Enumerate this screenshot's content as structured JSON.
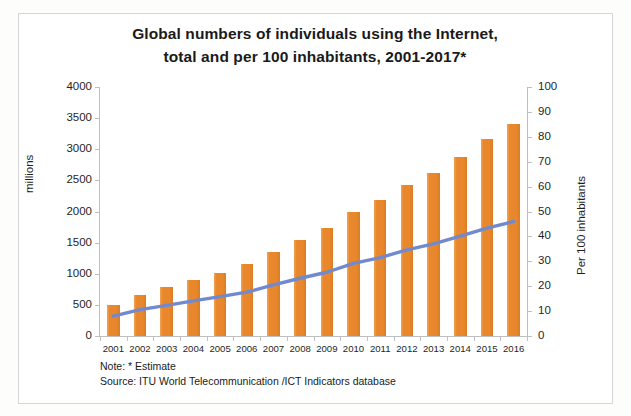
{
  "title": {
    "line1": "Global numbers of individuals using the Internet,",
    "line2": "total and per 100 inhabitants, 2001-2017*"
  },
  "legend": {
    "label": "Individuals using the Internet (in millions)",
    "swatch_color": "#e8872b"
  },
  "axes": {
    "left_title": "millions",
    "right_title": "Per 100 inhabitants",
    "left_ticks": [
      "0",
      "500",
      "1000",
      "1500",
      "2000",
      "2500",
      "3000",
      "3500",
      "4000"
    ],
    "right_ticks": [
      "0",
      "10",
      "20",
      "30",
      "40",
      "50",
      "60",
      "70",
      "80",
      "90",
      "100"
    ]
  },
  "footnote": {
    "note": "Note: * Estimate",
    "source": "Source:  ITU World Telecommunication /ICT Indicators database"
  },
  "colors": {
    "bar": "#e8872b",
    "line": "#7089cf",
    "axis": "#bfbfbf",
    "text": "#1a1a1a",
    "frame": "#d6d6d6"
  },
  "chart_data": {
    "type": "bar",
    "title": "Global numbers of individuals using the Internet, total and per 100 inhabitants, 2001-2017*",
    "xlabel": "",
    "ylabel": "millions",
    "y2label": "Per 100 inhabitants",
    "ylim": [
      0,
      4000
    ],
    "y2lim": [
      0,
      100
    ],
    "ytick_step": 500,
    "y2tick_step": 10,
    "grid": false,
    "legend_position": "upper-left-inside",
    "categories": [
      "2001",
      "2002",
      "2003",
      "2004",
      "2005",
      "2006",
      "2007",
      "2008",
      "2009",
      "2010",
      "2011",
      "2012",
      "2013",
      "2014",
      "2015",
      "2016"
    ],
    "series": [
      {
        "name": "Individuals using the Internet (in millions)",
        "type": "bar",
        "axis": "left",
        "color": "#e8872b",
        "values": [
          495,
          665,
          780,
          900,
          1020,
          1150,
          1350,
          1550,
          1730,
          2000,
          2180,
          2420,
          2620,
          2880,
          3160,
          3400
        ]
      },
      {
        "name": "Per 100 inhabitants",
        "type": "line",
        "axis": "right",
        "color": "#7089cf",
        "values": [
          8.0,
          10.6,
          12.3,
          14.1,
          15.8,
          17.6,
          20.5,
          23.2,
          25.6,
          29.2,
          31.5,
          34.6,
          37.0,
          40.1,
          43.3,
          46.0
        ]
      }
    ],
    "annotations": [
      "Note: * Estimate",
      "Source:  ITU World Telecommunication /ICT Indicators database"
    ]
  }
}
